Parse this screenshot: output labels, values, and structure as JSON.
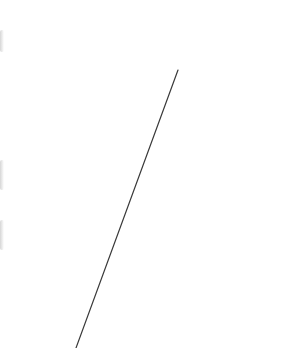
{
  "canvas": {
    "background": "#ffffff",
    "line": {
      "x1": 178,
      "y1": 70,
      "x2": 76,
      "y2": 348,
      "color": "#3a3a3a",
      "width": 1.2
    },
    "edge_marks": [
      {
        "top": 30,
        "height": 22
      },
      {
        "top": 160,
        "height": 30
      },
      {
        "top": 220,
        "height": 30
      }
    ]
  }
}
